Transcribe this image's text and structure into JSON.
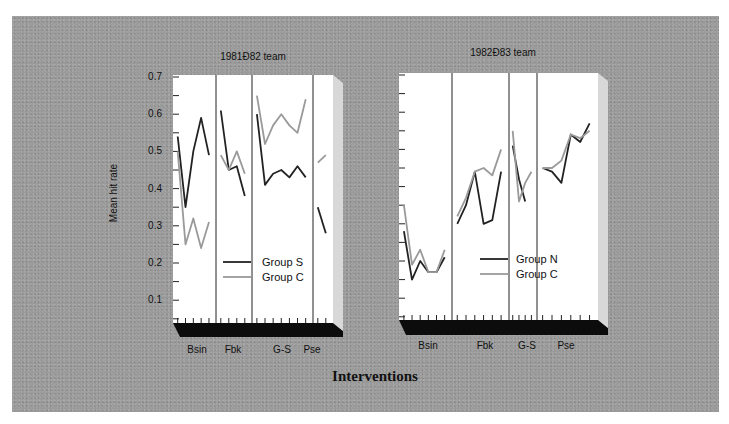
{
  "chart_data": [
    {
      "type": "line",
      "title": "1981Ð82 team",
      "xlabel": "Interventions",
      "ylabel": "Mean hit rate",
      "ylim": [
        0.05,
        0.7
      ],
      "yticks": [
        0.1,
        0.2,
        0.3,
        0.4,
        0.5,
        0.6,
        0.7
      ],
      "phases": [
        "Bsin",
        "Fbk",
        "G-S",
        "Pse"
      ],
      "legend": {
        "position": "lower-center",
        "entries": [
          "Group S",
          "Group C"
        ]
      },
      "series": [
        {
          "name": "Group S",
          "color": "#222222",
          "segments": {
            "Bsin": [
              0.54,
              0.35,
              0.5,
              0.59,
              0.49
            ],
            "Fbk": [
              0.61,
              0.45,
              0.46,
              0.38
            ],
            "G-S": [
              0.6,
              0.41,
              0.44,
              0.45,
              0.43,
              0.46,
              0.43
            ],
            "Pse": [
              0.35,
              0.28
            ]
          }
        },
        {
          "name": "Group C",
          "color": "#9a9a9a",
          "segments": {
            "Bsin": [
              0.5,
              0.25,
              0.32,
              0.24,
              0.31
            ],
            "Fbk": [
              0.49,
              0.45,
              0.5,
              0.44
            ],
            "G-S": [
              0.65,
              0.52,
              0.57,
              0.6,
              0.57,
              0.55,
              0.64
            ],
            "Pse": [
              0.47,
              0.49
            ]
          }
        }
      ]
    },
    {
      "type": "line",
      "title": "1982Ð83 team",
      "xlabel": "Interventions",
      "ylabel": "Mean hit rate",
      "ylim": [
        0.05,
        0.7
      ],
      "phases": [
        "Bsin",
        "Fbk",
        "G-S",
        "Pse"
      ],
      "legend": {
        "position": "lower-center",
        "entries": [
          "Group N",
          "Group C"
        ]
      },
      "series": [
        {
          "name": "Group N",
          "color": "#222222",
          "segments": {
            "Bsin": [
              0.28,
              0.15,
              0.2,
              0.17,
              0.17,
              0.21
            ],
            "Fbk": [
              0.3,
              0.35,
              0.44,
              0.3,
              0.31,
              0.44
            ],
            "G-S": [
              0.51,
              0.42,
              0.36
            ],
            "Pse": [
              0.45,
              0.44,
              0.41,
              0.54,
              0.52,
              0.57
            ]
          }
        },
        {
          "name": "Group C",
          "color": "#9a9a9a",
          "segments": {
            "Bsin": [
              0.35,
              0.19,
              0.23,
              0.17,
              0.17,
              0.23
            ],
            "Fbk": [
              0.32,
              0.37,
              0.44,
              0.45,
              0.43,
              0.5
            ],
            "G-S": [
              0.55,
              0.36,
              0.41,
              0.44
            ],
            "Pse": [
              0.45,
              0.45,
              0.47,
              0.54,
              0.53,
              0.55
            ]
          }
        }
      ]
    }
  ],
  "labels": {
    "left_title": "1981Ð82 team",
    "right_title": "1982Ð83 team",
    "y_axis": "Mean hit rate",
    "x_axis": "Interventions",
    "yticks": [
      "0.7",
      "0.6",
      "0.5",
      "0.4",
      "0.3",
      "0.2",
      "0.1"
    ],
    "left_phases": [
      "Bsin",
      "Fbk",
      "G-S",
      "Pse"
    ],
    "right_phases": [
      "Bsin",
      "Fbk",
      "G-S",
      "Pse"
    ],
    "left_legend": [
      "Group S",
      "Group C"
    ],
    "right_legend": [
      "Group N",
      "Group C"
    ]
  }
}
